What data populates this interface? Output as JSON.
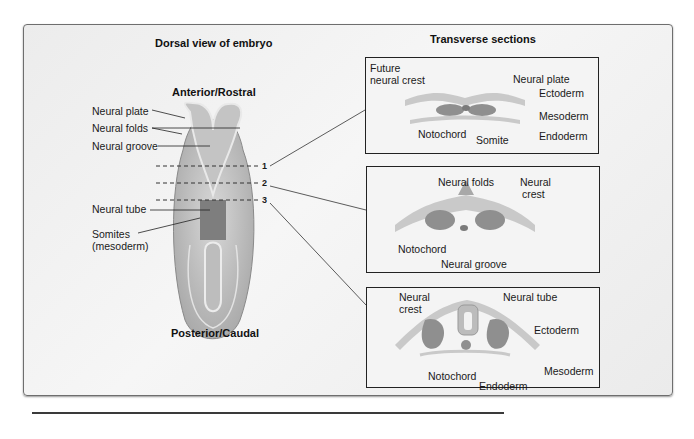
{
  "left_panel": {
    "title": "Dorsal view of embryo",
    "top_label": "Anterior/Rostral",
    "bottom_label": "Posterior/Caudal",
    "labels": {
      "neural_plate": "Neural plate",
      "neural_folds": "Neural folds",
      "neural_groove": "Neural groove",
      "neural_tube": "Neural tube",
      "somites_line1": "Somites",
      "somites_line2": "(mesoderm)"
    },
    "section_markers": [
      "1",
      "2",
      "3"
    ]
  },
  "right_panel": {
    "title": "Transverse sections",
    "section1": {
      "future_neural_crest_line1": "Future",
      "future_neural_crest_line2": "neural crest",
      "neural_plate": "Neural plate",
      "ectoderm": "Ectoderm",
      "mesoderm": "Mesoderm",
      "endoderm": "Endoderm",
      "notochord": "Notochord",
      "somite": "Somite"
    },
    "section2": {
      "neural_folds": "Neural folds",
      "neural_crest_line1": "Neural",
      "neural_crest_line2": "crest",
      "notochord": "Notochord",
      "neural_groove": "Neural groove"
    },
    "section3": {
      "neural_crest_line1": "Neural",
      "neural_crest_line2": "crest",
      "neural_tube": "Neural tube",
      "ectoderm": "Ectoderm",
      "mesoderm": "Mesoderm",
      "notochord": "Notochord",
      "endoderm": "Endoderm"
    }
  },
  "colors": {
    "ectoderm": "#c9c9c9",
    "mesoderm": "#8f8f8f",
    "neural": "#a8a8a8",
    "line": "#222222"
  }
}
